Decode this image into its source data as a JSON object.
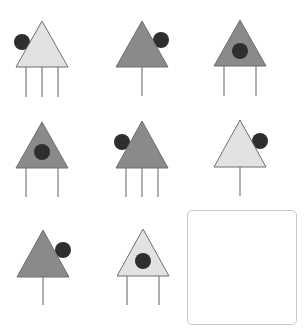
{
  "puzzle": {
    "title": "",
    "colors": {
      "light_fill": "#e2e2e2",
      "dark_fill": "#8a8a8a",
      "outline": "#6f6f6f",
      "dot": "#2e2e2e",
      "leg": "#7a7a7a",
      "answer_border": "#c8c8c8"
    },
    "figures": [
      {
        "id": 1,
        "cx": 42,
        "apex_y": 21,
        "base_y": 67,
        "half_w": 26,
        "shade": "light",
        "dot": "outside-left",
        "dot_x": 22,
        "dot_y": 42,
        "legs": 3,
        "leg_end": 97
      },
      {
        "id": 2,
        "cx": 142,
        "apex_y": 21,
        "base_y": 67,
        "half_w": 26,
        "shade": "dark",
        "dot": "outside-right",
        "dot_x": 161,
        "dot_y": 40,
        "legs": 1,
        "leg_end": 96
      },
      {
        "id": 3,
        "cx": 240,
        "apex_y": 20,
        "base_y": 66,
        "half_w": 26,
        "shade": "dark",
        "dot": "inside",
        "dot_x": 240,
        "dot_y": 51,
        "legs": 2,
        "leg_end": 96
      },
      {
        "id": 4,
        "cx": 42,
        "apex_y": 122,
        "base_y": 168,
        "half_w": 26,
        "shade": "dark",
        "dot": "inside",
        "dot_x": 42,
        "dot_y": 152,
        "legs": 2,
        "leg_end": 197
      },
      {
        "id": 5,
        "cx": 142,
        "apex_y": 121,
        "base_y": 168,
        "half_w": 26,
        "shade": "dark",
        "dot": "outside-left",
        "dot_x": 122,
        "dot_y": 142,
        "legs": 3,
        "leg_end": 197
      },
      {
        "id": 6,
        "cx": 240,
        "apex_y": 120,
        "base_y": 167,
        "half_w": 26,
        "shade": "light",
        "dot": "outside-right",
        "dot_x": 260,
        "dot_y": 141,
        "legs": 1,
        "leg_end": 196
      },
      {
        "id": 7,
        "cx": 43,
        "apex_y": 230,
        "base_y": 277,
        "half_w": 26,
        "shade": "dark",
        "dot": "outside-right",
        "dot_x": 63,
        "dot_y": 250,
        "legs": 1,
        "leg_end": 305
      },
      {
        "id": 8,
        "cx": 143,
        "apex_y": 229,
        "base_y": 276,
        "half_w": 26,
        "shade": "light",
        "dot": "inside",
        "dot_x": 143,
        "dot_y": 261,
        "legs": 2,
        "leg_end": 305
      }
    ],
    "answer_slot": {
      "label": "",
      "empty": true
    }
  }
}
